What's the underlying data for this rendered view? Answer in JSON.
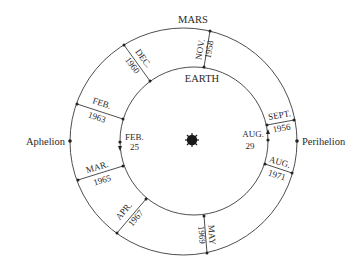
{
  "diagram": {
    "title_outer": "MARS",
    "title_inner": "EARTH",
    "aphelion_label": "Aphelion",
    "perihelion_label": "Perihelion",
    "sun_icon": "sun-icon",
    "earth_markers": [
      {
        "month": "FEB.",
        "day": "25"
      },
      {
        "month": "AUG.",
        "day": "29"
      }
    ],
    "oppositions": [
      {
        "month": "SEPT.",
        "year": "1956"
      },
      {
        "month": "NOV.",
        "year": "1958"
      },
      {
        "month": "DEC.",
        "year": "1960"
      },
      {
        "month": "FEB.",
        "year": "1963"
      },
      {
        "month": "MAR.",
        "year": "1965"
      },
      {
        "month": "APR.",
        "year": "1967"
      },
      {
        "month": "MAY",
        "year": "1969"
      },
      {
        "month": "AUG.",
        "year": "1971"
      }
    ],
    "colors": {
      "line": "#3a3a3a",
      "text": "#2a2a2a",
      "background": "#ffffff"
    }
  }
}
